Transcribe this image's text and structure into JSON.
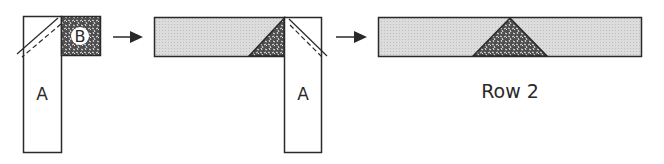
{
  "diagram": {
    "step1": {
      "strip_label": "A",
      "square_label": "B"
    },
    "step2": {
      "strip_label": "A"
    },
    "step3": {
      "caption": "Row 2"
    },
    "colors": {
      "stroke": "#2a2a2a",
      "light_fill": "#d9d9d9",
      "dark_fill": "#5a5a5a",
      "background": "#ffffff"
    },
    "arrows": [
      "arrow-right",
      "arrow-right"
    ]
  }
}
